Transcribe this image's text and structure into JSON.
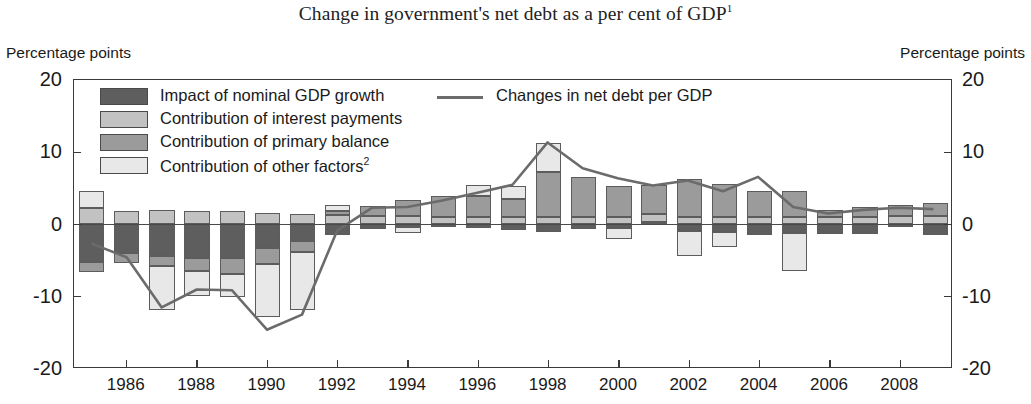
{
  "title": "Change in government's net debt as a per cent of GDP",
  "title_footnote": "1",
  "axis_caption_left": "Percentage points",
  "axis_caption_right": "Percentage points",
  "legend": {
    "items": [
      {
        "label": "Impact of nominal GDP growth",
        "color": "#5e5e5e"
      },
      {
        "label": "Contribution of interest payments",
        "color": "#c2c2c2"
      },
      {
        "label": "Contribution of primary balance",
        "color": "#9b9b9b"
      },
      {
        "label": "Contribution of other factors",
        "footnote": "2",
        "color": "#e8e8e8"
      }
    ],
    "line_label": "Changes in net debt per GDP",
    "line_color": "#6b6b6b"
  },
  "chart_data": {
    "type": "bar",
    "title": "Change in government's net debt as a per cent of GDP",
    "xlabel": "",
    "ylabel": "Percentage points",
    "ylim": [
      -20,
      20
    ],
    "yticks": [
      20,
      10,
      0,
      -10,
      -20
    ],
    "grid": false,
    "legend_position": "top-left",
    "stacked": true,
    "categories": [
      1985,
      1986,
      1987,
      1988,
      1989,
      1990,
      1991,
      1992,
      1993,
      1994,
      1995,
      1996,
      1997,
      1998,
      1999,
      2000,
      2001,
      2002,
      2003,
      2004,
      2005,
      2006,
      2007,
      2008,
      2009
    ],
    "xtick_labels": [
      "1986",
      "1988",
      "1990",
      "1992",
      "1994",
      "1996",
      "1998",
      "2000",
      "2002",
      "2004",
      "2006",
      "2008"
    ],
    "series": [
      {
        "name": "Impact of nominal GDP growth",
        "color": "#5e5e5e",
        "values": [
          -5.2,
          -4.0,
          -4.3,
          -4.6,
          -4.6,
          -3.3,
          -2.3,
          -1.5,
          -0.6,
          -0.3,
          -0.3,
          -0.5,
          -0.7,
          -1.1,
          -0.6,
          -0.5,
          0.4,
          -0.9,
          -1.1,
          -1.5,
          -1.2,
          -1.3,
          -1.3,
          -0.3,
          -1.5
        ]
      },
      {
        "name": "Contribution of interest payments",
        "color": "#c2c2c2",
        "values": [
          2.3,
          1.9,
          2.0,
          1.8,
          1.8,
          1.6,
          1.4,
          1.3,
          1.2,
          1.2,
          1.1,
          1.0,
          1.0,
          1.0,
          1.0,
          1.0,
          1.0,
          1.0,
          1.0,
          1.0,
          1.0,
          1.0,
          1.1,
          1.2,
          1.2
        ]
      },
      {
        "name": "Contribution of primary balance",
        "color": "#9b9b9b",
        "values": [
          -1.4,
          -1.3,
          -1.5,
          -1.8,
          -2.2,
          -2.1,
          -1.5,
          0.6,
          1.4,
          2.2,
          2.8,
          3.0,
          2.5,
          6.2,
          5.6,
          4.3,
          4.0,
          5.3,
          4.6,
          3.6,
          3.6,
          1.0,
          1.3,
          1.5,
          1.8
        ]
      },
      {
        "name": "Contribution of other factors",
        "color": "#e8e8e8",
        "values": [
          2.4,
          0.0,
          -6.0,
          -3.5,
          -3.2,
          -7.4,
          -8.0,
          0.8,
          0.0,
          -0.9,
          0.0,
          1.5,
          1.8,
          4.1,
          0.0,
          -1.5,
          0.0,
          -3.4,
          -2.0,
          0.0,
          -5.3,
          0.0,
          0.0,
          0.0,
          0.0
        ]
      }
    ],
    "line_series": {
      "name": "Changes in net debt per GDP",
      "color": "#6b6b6b",
      "values": [
        -2.8,
        -4.7,
        -11.7,
        -9.2,
        -9.3,
        -14.8,
        -12.7,
        -1.0,
        2.2,
        2.3,
        3.2,
        4.3,
        5.4,
        11.3,
        7.7,
        6.3,
        5.3,
        6.0,
        4.5,
        6.5,
        2.3,
        1.4,
        1.9,
        2.2,
        2.0
      ]
    }
  }
}
